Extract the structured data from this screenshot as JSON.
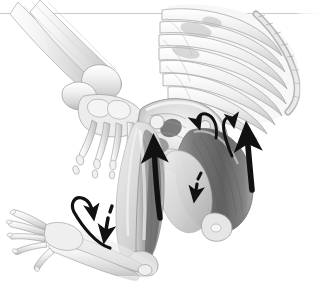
{
  "figure": {
    "alt_text": "Grayscale medical illustration showing a partial human skeleton in an inverted crouched pose: rib cage and spine upper right, pelvis center, femur and lower leg bones, a foot skeleton upper left, a hand and forearm lower left, with shaded muscles and black directional arrows",
    "background_color": "#ffffff",
    "border": {
      "name": "top-divider-rule",
      "color": "#c9c9c9",
      "y": 13,
      "thickness": 1
    },
    "palette": {
      "paper": "#ffffff",
      "bone_light": "#f2f2f2",
      "bone_mid": "#d8d8d8",
      "bone_shadow": "#b0b0b0",
      "muscle_dark": "#6d6d6d",
      "muscle_mid": "#9a9a9a",
      "muscle_light": "#c4c4c4",
      "outline": "#8c8c8c",
      "arrow": "#111111"
    },
    "structures": [
      {
        "name": "rib-cage",
        "label": "Rib cage and thoracic vertebrae",
        "region": "upper-right"
      },
      {
        "name": "vertebral-column",
        "label": "Vertebral column",
        "region": "upper-right"
      },
      {
        "name": "pelvis",
        "label": "Pelvis (ilium, ischium, sacrum)",
        "region": "center"
      },
      {
        "name": "femur-left",
        "label": "Femur with hamstring muscle",
        "region": "center-lower"
      },
      {
        "name": "femur-right",
        "label": "Femur with shaded thigh muscle",
        "region": "right-lower"
      },
      {
        "name": "tibia-fibula",
        "label": "Tibia and fibula",
        "region": "upper-left"
      },
      {
        "name": "foot-skeleton",
        "label": "Foot skeleton: tarsals, metatarsals, phalanges",
        "region": "upper-left"
      },
      {
        "name": "hand-skeleton",
        "label": "Hand skeleton: carpals, metacarpals, phalanges",
        "region": "lower-left"
      },
      {
        "name": "forearm-bones",
        "label": "Radius and ulna",
        "region": "lower-left"
      },
      {
        "name": "knee-joint",
        "label": "Knee joint",
        "region": "lower-center"
      }
    ],
    "arrows": [
      {
        "name": "arrow-hand-rotation",
        "style": "curved-hook",
        "color": "#111111",
        "direction": "clockwise-down-right",
        "region": "lower-left-hand"
      },
      {
        "name": "arrow-forearm-down",
        "style": "dashed-straight",
        "color": "#111111",
        "direction": "down",
        "region": "lower-left-forearm"
      },
      {
        "name": "arrow-hamstring-up",
        "style": "solid-straight-thick",
        "color": "#111111",
        "direction": "up",
        "region": "center-left-thigh"
      },
      {
        "name": "arrow-pelvis-hook",
        "style": "curved-hook",
        "color": "#111111",
        "direction": "up-left",
        "region": "center-pelvis"
      },
      {
        "name": "arrow-pelvis-down",
        "style": "dashed-straight",
        "color": "#111111",
        "direction": "down",
        "region": "center-below-pelvis"
      },
      {
        "name": "arrow-thigh-up-right",
        "style": "solid-straight-thick",
        "color": "#111111",
        "direction": "up",
        "region": "right-thigh"
      },
      {
        "name": "arrow-gluteal-hook",
        "style": "curved-hook",
        "color": "#111111",
        "direction": "up",
        "region": "right-hip"
      }
    ]
  }
}
